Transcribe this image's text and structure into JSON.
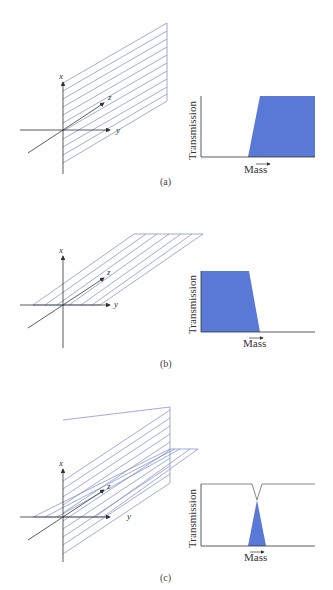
{
  "figure": {
    "panels": [
      {
        "caption": "(a)",
        "plane": "vertical (x-z plane)",
        "axes": {
          "x": "x",
          "y": "y",
          "z": "z"
        },
        "graph": {
          "ylabel": "Transmission",
          "xlabel": "Mass",
          "shape": "high-pass"
        }
      },
      {
        "caption": "(b)",
        "plane": "horizontal (y-z plane)",
        "axes": {
          "x": "x",
          "y": "y",
          "z": "z"
        },
        "graph": {
          "ylabel": "Transmission",
          "xlabel": "Mass",
          "shape": "low-pass"
        }
      },
      {
        "caption": "(c)",
        "plane": "vertical and horizontal combined",
        "axes": {
          "x": "x",
          "y": "y",
          "z": "z"
        },
        "graph": {
          "ylabel": "Transmission",
          "xlabel": "Mass",
          "shape": "band-pass"
        }
      }
    ],
    "colors": {
      "fill": "#5a78d6",
      "plane_lines": "#7b86c8",
      "axis": "#333333"
    }
  }
}
